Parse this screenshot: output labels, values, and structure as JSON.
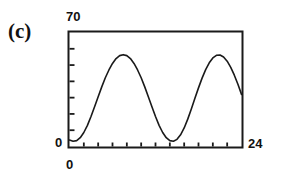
{
  "figure": {
    "panel_label": "(c)",
    "background_color": "#ffffff",
    "ink_color": "#1a1a1a"
  },
  "axes": {
    "y_max_label": "70",
    "y_min_label": "0",
    "x_min_label": "0",
    "x_max_label": "24"
  },
  "chart_data": {
    "type": "line",
    "title": "(c)",
    "xlabel": "",
    "ylabel": "",
    "xlim": [
      0,
      24
    ],
    "ylim": [
      0,
      70
    ],
    "grid": false,
    "legend": null,
    "xticks": [
      0,
      2,
      4,
      6,
      8,
      10,
      12,
      14,
      16,
      18,
      20,
      22,
      24
    ],
    "xticklabels": [
      "0",
      "",
      "",
      "",
      "",
      "",
      "",
      "",
      "",
      "",
      "",
      "",
      "24"
    ],
    "yticks": [
      0,
      10,
      20,
      30,
      40,
      50,
      60,
      70
    ],
    "yticklabels": [
      "0",
      "",
      "",
      "",
      "",
      "",
      "",
      "70"
    ],
    "series": [
      {
        "name": "signal",
        "x": [
          0.0,
          0.5,
          1.0,
          1.5,
          2.0,
          2.5,
          3.0,
          3.5,
          4.0,
          4.5,
          5.0,
          5.5,
          6.0,
          6.5,
          7.0,
          7.5,
          8.0,
          8.5,
          9.0,
          9.5,
          10.0,
          10.5,
          11.0,
          11.5,
          12.0,
          12.5,
          13.0,
          13.5,
          14.0,
          14.5,
          15.0,
          15.5,
          16.0,
          16.5,
          17.0,
          17.5,
          18.0,
          18.5,
          19.0,
          19.5,
          20.0,
          20.5,
          21.0,
          21.5,
          22.0,
          22.5,
          23.0,
          23.5,
          24.0
        ],
        "y": [
          4.0,
          3.2,
          3.6,
          5.4,
          8.6,
          13.0,
          18.4,
          24.4,
          30.6,
          36.6,
          42.2,
          47.0,
          51.0,
          54.0,
          55.8,
          56.4,
          55.8,
          54.0,
          51.0,
          47.0,
          42.2,
          36.6,
          30.6,
          24.4,
          18.4,
          13.0,
          8.6,
          5.4,
          3.6,
          3.2,
          4.4,
          7.2,
          11.4,
          16.8,
          23.0,
          29.6,
          36.0,
          42.0,
          47.2,
          51.4,
          54.4,
          56.0,
          56.2,
          55.0,
          52.4,
          48.6,
          43.8,
          38.2,
          32.0
        ]
      }
    ]
  }
}
